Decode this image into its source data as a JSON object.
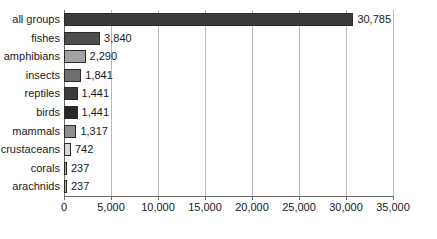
{
  "chart_data": {
    "type": "bar",
    "orientation": "horizontal",
    "title": "",
    "xlabel": "",
    "ylabel": "",
    "xlim": [
      0,
      35000
    ],
    "xticks": [
      0,
      5000,
      10000,
      15000,
      20000,
      25000,
      30000,
      35000
    ],
    "xtick_labels": [
      "0",
      "5,000",
      "10,000",
      "15,000",
      "20,000",
      "25,000",
      "30,000",
      "35,000"
    ],
    "grid": true,
    "grid_axis": "x",
    "legend": false,
    "categories": [
      "all groups",
      "fishes",
      "amphibians",
      "insects",
      "reptiles",
      "birds",
      "mammals",
      "crustaceans",
      "corals",
      "arachnids"
    ],
    "values": [
      30785,
      3840,
      2290,
      1841,
      1441,
      1441,
      1317,
      742,
      237,
      237
    ],
    "value_labels": [
      "30,785",
      "3,840",
      "2,290",
      "1,841",
      "1,441",
      "1,441",
      "1,317",
      "742",
      "237",
      "237"
    ],
    "bar_colors": [
      "#3a3a3a",
      "#4d4d4d",
      "#a3a3a3",
      "#6e6e6e",
      "#3c3c3c",
      "#262626",
      "#8e8e8e",
      "#d6d6d6",
      "#9a9a9a",
      "#b0b0b0"
    ],
    "bar_border_color": "#2a2a2a",
    "axis_color": "#6d6d6d",
    "grid_color": "#b9b9b9",
    "background": "#ffffff",
    "text_color": "#1a1a1a"
  }
}
